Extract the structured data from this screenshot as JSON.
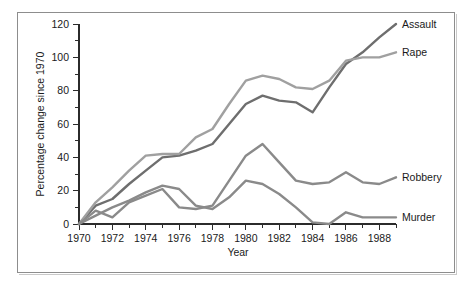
{
  "chart_data": {
    "type": "line",
    "title": "",
    "xlabel": "Year",
    "ylabel": "Percentage change since 1970",
    "xlim": [
      1970,
      1989
    ],
    "ylim": [
      0,
      120
    ],
    "grid": false,
    "legend_position": "right-inline-labels",
    "x_major_ticks": [
      1970,
      1972,
      1974,
      1976,
      1978,
      1980,
      1982,
      1984,
      1986,
      1988
    ],
    "x_minor_ticks": [
      1971,
      1973,
      1975,
      1977,
      1979,
      1981,
      1983,
      1985,
      1987,
      1989
    ],
    "x_tick_labels": [
      "1970",
      "1972",
      "1974",
      "1976",
      "1978",
      "1980",
      "1982",
      "1984",
      "1986",
      "1988"
    ],
    "y_major_ticks": [
      0,
      20,
      40,
      60,
      80,
      100,
      120
    ],
    "y_minor_ticks": [
      10,
      30,
      50,
      70,
      90,
      110
    ],
    "y_tick_labels": [
      "0",
      "20",
      "40",
      "60",
      "80",
      "100",
      "120"
    ],
    "x": [
      1970,
      1971,
      1972,
      1973,
      1974,
      1975,
      1976,
      1977,
      1978,
      1979,
      1980,
      1981,
      1982,
      1983,
      1984,
      1985,
      1986,
      1987,
      1988,
      1989
    ],
    "series": [
      {
        "name": "Assault",
        "color": "#6e6e6e",
        "label": "Assault",
        "values": [
          0,
          11,
          15,
          24,
          32,
          40,
          41,
          44,
          48,
          60,
          72,
          77,
          74,
          73,
          67,
          82,
          96,
          103,
          112,
          120
        ]
      },
      {
        "name": "Rape",
        "color": "#a0a0a0",
        "label": "Rape",
        "values": [
          0,
          13,
          22,
          32,
          41,
          42,
          42,
          52,
          57,
          72,
          86,
          89,
          87,
          82,
          81,
          86,
          98,
          100,
          100,
          103
        ]
      },
      {
        "name": "Robbery",
        "color": "#8a8a8a",
        "label": "Robbery",
        "values": [
          0,
          8,
          4,
          13,
          17,
          21,
          10,
          9,
          11,
          26,
          41,
          48,
          37,
          26,
          24,
          25,
          31,
          25,
          24,
          28
        ]
      },
      {
        "name": "Murder",
        "color": "#8a8a8a",
        "label": "Murder",
        "values": [
          0,
          5,
          10,
          14,
          19,
          23,
          21,
          11,
          9,
          16,
          26,
          24,
          18,
          10,
          1,
          0,
          7,
          4,
          4,
          4
        ]
      }
    ]
  },
  "axes": {
    "y_title": "Percentage change since 1970",
    "x_title": "Year"
  },
  "colors": {
    "frame": "#8d8d8d",
    "axis": "#2b2b2b",
    "background": "#ffffff"
  }
}
